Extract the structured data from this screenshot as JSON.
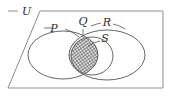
{
  "figure": {
    "type": "venn-diagram",
    "width": 171,
    "height": 104,
    "background_color": "#ffffff"
  },
  "universe": {
    "label": "U",
    "frame_color": "#8c8c8c",
    "label_color": "#2b2b2b",
    "frame": {
      "x": 8,
      "y": 11,
      "width": 155,
      "height": 77
    },
    "label_gap": {
      "x": 18,
      "width": 22
    }
  },
  "labels": {
    "p": "P",
    "q": "Q",
    "r": "R",
    "s": "S",
    "u": "U"
  },
  "sets": [
    {
      "name": "P",
      "label": "P",
      "shape": "ellipse",
      "cx": 63,
      "cy": 55,
      "rx": 35,
      "ry": 24,
      "stroke_color": "#555555",
      "label_x": 57,
      "label_y": 31
    },
    {
      "name": "R",
      "label": "R",
      "shape": "ellipse",
      "cx": 107,
      "cy": 55,
      "rx": 38,
      "ry": 25,
      "stroke_color": "#555555",
      "label_x": 106,
      "label_y": 27
    },
    {
      "name": "S",
      "label": "S",
      "shape": "ellipse",
      "cx": 92,
      "cy": 56,
      "rx": 21,
      "ry": 19,
      "stroke_color": "#555555",
      "label_x": 104,
      "label_y": 41
    },
    {
      "name": "Q",
      "label": "Q",
      "shape": "label-only",
      "label_x": 81,
      "label_y": 24
    }
  ],
  "shaded_regions": [
    {
      "name": "P-intersect-R",
      "pattern": "diagonal-hatch",
      "pattern_color": "#6f6f6f",
      "fill_color": "#f2f2f2",
      "description": "lens of P and R, hatched with diagonal lines"
    },
    {
      "name": "P-intersect-S",
      "pattern": "cross-hatch",
      "pattern_color": "#4a4a4a",
      "fill_color": "#d8d8d8",
      "description": "overlap of P and inner circle S, darker cross-hatch"
    }
  ],
  "leader_lines": [
    {
      "name": "p-leader",
      "from_label": "P",
      "d": "M 44 28 L 52 28"
    },
    {
      "name": "p-leader-right",
      "from_label": "P",
      "d": "M 64 29 L 79 37"
    },
    {
      "name": "q-leader",
      "from_label": "Q",
      "d": "M 83 28 L 83 36"
    },
    {
      "name": "r-leader-left",
      "from_label": "R",
      "d": "M 92 26 L 101 24"
    },
    {
      "name": "r-leader-right",
      "from_label": "R",
      "d": "M 113 25 L 124 29"
    },
    {
      "name": "s-leader",
      "from_label": "S",
      "d": "M 100 40 L 88 45"
    }
  ]
}
